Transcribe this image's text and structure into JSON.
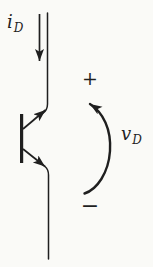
{
  "diagram": {
    "labels": {
      "current": {
        "base": "i",
        "sub": "D"
      },
      "voltage": {
        "base": "v",
        "sub": "D",
        "plus": "+",
        "minus": "−"
      }
    },
    "colors": {
      "ink": "#1f1f1f",
      "paper": "#fafaf7"
    }
  }
}
